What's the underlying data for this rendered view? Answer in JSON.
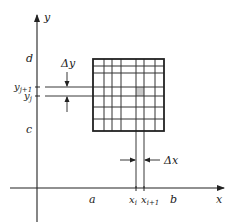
{
  "diagram": {
    "type": "grid-partition-of-rectangle",
    "axes": {
      "x_label": "x",
      "y_label": "y"
    },
    "x_ticks": {
      "a": "a",
      "xi": "x",
      "xi_sub": "i",
      "xi1": "x",
      "xi1_sub": "i+1",
      "b": "b"
    },
    "y_ticks": {
      "c": "c",
      "d": "d",
      "yi": "y",
      "yi_sub": "j",
      "yi1": "y",
      "yi1_sub": "j+1"
    },
    "deltas": {
      "dx": "Δx",
      "dy": "Δy"
    },
    "colors": {
      "line": "#222222",
      "grid": "#333333",
      "shaded_cell": "#c8c8c8"
    },
    "grid": {
      "vertical_lines_x": [
        104,
        112,
        121,
        136,
        144,
        155
      ],
      "horizontal_lines_y": [
        66,
        73,
        87,
        96,
        107,
        119
      ]
    }
  }
}
